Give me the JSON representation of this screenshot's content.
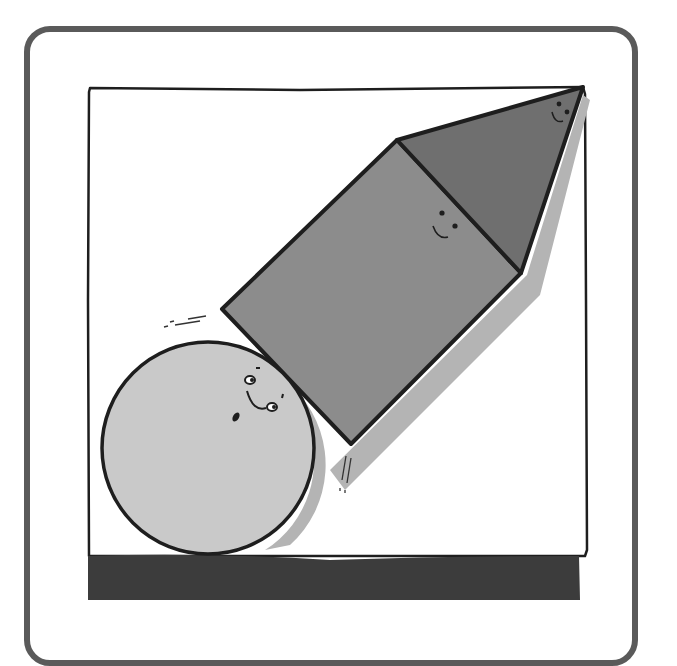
{
  "illustration": {
    "title": "Circle, square and triangle characters",
    "colors": {
      "card_border": "#5a5a5a",
      "frame_line": "#1e1e1e",
      "ground": "#3c3c3c",
      "circle_fill": "#c9c9c9",
      "square_fill": "#8c8c8c",
      "triangle_fill": "#6f6f6f",
      "shadow": "#b4b4b4",
      "background": "#ffffff"
    },
    "shapes": [
      {
        "name": "circle",
        "face": "smiling"
      },
      {
        "name": "square",
        "face": "smiling"
      },
      {
        "name": "triangle",
        "face": "smiling"
      }
    ]
  }
}
